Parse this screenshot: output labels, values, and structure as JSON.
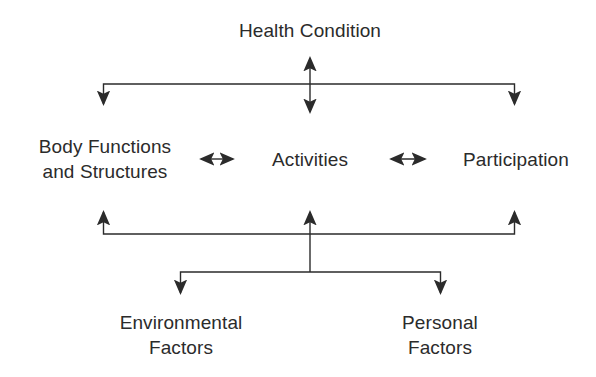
{
  "diagram": {
    "type": "flow-diagram",
    "background_color": "#ffffff",
    "line_color": "#2b2b2b",
    "text_color": "#2b2b2b",
    "nodes": [
      {
        "id": "health_condition",
        "label": "Health Condition",
        "lines": [
          "Health Condition"
        ],
        "x": 310,
        "y": 30
      },
      {
        "id": "body_functions",
        "label": "Body Functions and Structures",
        "lines": [
          "Body Functions",
          "and Structures"
        ],
        "x": 105,
        "y": 159
      },
      {
        "id": "activities",
        "label": "Activities",
        "lines": [
          "Activities"
        ],
        "x": 310,
        "y": 159
      },
      {
        "id": "participation",
        "label": "Participation",
        "lines": [
          "Participation"
        ],
        "x": 516,
        "y": 159
      },
      {
        "id": "environmental_factors",
        "label": "Environmental Factors",
        "lines": [
          "Environmental",
          "Factors"
        ],
        "x": 181,
        "y": 322
      },
      {
        "id": "personal_factors",
        "label": "Personal Factors",
        "lines": [
          "Personal",
          "Factors"
        ],
        "x": 440,
        "y": 322
      }
    ],
    "connectors": [
      {
        "id": "health-to-activities",
        "from": "health_condition",
        "to": "activities",
        "style": "double-arrow-vertical"
      },
      {
        "id": "health-bus-to-body",
        "from": "health_condition",
        "to": "body_functions",
        "style": "elbow-arrow-down"
      },
      {
        "id": "health-bus-to-participation",
        "from": "health_condition",
        "to": "participation",
        "style": "elbow-arrow-down"
      },
      {
        "id": "body-to-activities",
        "from": "body_functions",
        "to": "activities",
        "style": "double-arrow-horizontal"
      },
      {
        "id": "activities-to-participation",
        "from": "activities",
        "to": "participation",
        "style": "double-arrow-horizontal"
      },
      {
        "id": "factors-bus-to-body",
        "from": "contextual_factors",
        "to": "body_functions",
        "style": "elbow-arrow-up"
      },
      {
        "id": "factors-bus-to-activities",
        "from": "contextual_factors",
        "to": "activities",
        "style": "arrow-up"
      },
      {
        "id": "factors-bus-to-participation",
        "from": "contextual_factors",
        "to": "participation",
        "style": "elbow-arrow-up"
      },
      {
        "id": "bus-to-environmental",
        "from": "contextual_factors",
        "to": "environmental_factors",
        "style": "elbow-arrow-down"
      },
      {
        "id": "bus-to-personal",
        "from": "contextual_factors",
        "to": "personal_factors",
        "style": "elbow-arrow-down"
      }
    ]
  }
}
